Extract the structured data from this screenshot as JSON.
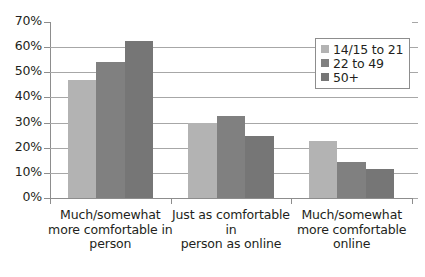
{
  "chart_data": {
    "type": "bar",
    "title": "",
    "xlabel": "",
    "ylabel": "",
    "ylim": [
      0,
      70
    ],
    "ytick_labels": [
      "0%",
      "10%",
      "20%",
      "30%",
      "40%",
      "50%",
      "60%",
      "70%"
    ],
    "ytick_values": [
      0,
      10,
      20,
      30,
      40,
      50,
      60,
      70
    ],
    "grid": true,
    "legend_position": "top-right",
    "categories": [
      "Much/somewhat more comfortable in person",
      "Just as comfortable in person as online",
      "Much/somewhat more comfortable online"
    ],
    "category_lines": [
      [
        "Much/somewhat",
        "more comfortable in",
        "person"
      ],
      [
        "Just as comfortable in",
        "person as online"
      ],
      [
        "Much/somewhat",
        "more comfortable",
        "online"
      ]
    ],
    "series": [
      {
        "name": "14/15 to 21",
        "color": "#b3b3b3",
        "values": [
          47,
          30,
          22.5
        ]
      },
      {
        "name": "22 to 49",
        "color": "#808080",
        "values": [
          54,
          32.7,
          14.5
        ]
      },
      {
        "name": "50+",
        "color": "#767676",
        "values": [
          62.5,
          24.5,
          11.5
        ]
      }
    ]
  },
  "legend": {
    "items": [
      {
        "label": "14/15 to 21"
      },
      {
        "label": "22 to 49"
      },
      {
        "label": "50+"
      }
    ]
  }
}
